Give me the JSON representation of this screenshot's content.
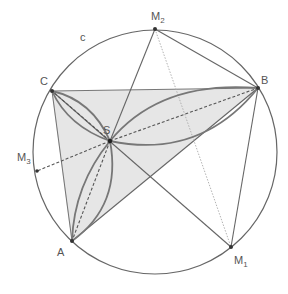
{
  "diagram": {
    "type": "geometry",
    "colors": {
      "stroke": "#666666",
      "lens_stroke": "#777777",
      "fill": "#e6e6e6",
      "point": "#333333",
      "dotted": "#aaaaaa",
      "text": "#555555"
    },
    "circle": {
      "label": "c",
      "cx": 155,
      "cy": 152,
      "r": 122
    },
    "points": {
      "A": {
        "label": "A",
        "x": 72,
        "y": 241
      },
      "B": {
        "label": "B",
        "x": 258,
        "y": 88
      },
      "C": {
        "label": "C",
        "x": 52,
        "y": 91
      },
      "S": {
        "label": "S",
        "x": 110,
        "y": 141
      },
      "M1": {
        "label": "M",
        "sub": "1",
        "x": 231,
        "y": 247
      },
      "M2": {
        "label": "M",
        "sub": "2",
        "x": 155,
        "y": 29
      },
      "M3": {
        "label": "M",
        "sub": "3",
        "x": 37,
        "y": 171
      }
    },
    "labels": {
      "circle": "c",
      "A": "A",
      "B": "B",
      "C": "C",
      "S": "S",
      "M1_main": "M",
      "M1_sub": "1",
      "M2_main": "M",
      "M2_sub": "2",
      "M3_main": "M",
      "M3_sub": "3"
    }
  }
}
